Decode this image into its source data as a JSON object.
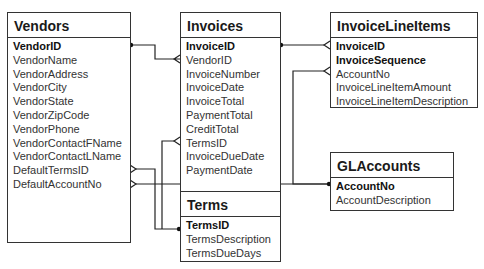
{
  "tables": {
    "vendors": {
      "name": "Vendors",
      "columns": [
        {
          "name": "VendorID",
          "pk": true
        },
        {
          "name": "VendorName",
          "pk": false
        },
        {
          "name": "VendorAddress",
          "pk": false
        },
        {
          "name": "VendorCity",
          "pk": false
        },
        {
          "name": "VendorState",
          "pk": false
        },
        {
          "name": "VendorZipCode",
          "pk": false
        },
        {
          "name": "VendorPhone",
          "pk": false
        },
        {
          "name": "VendorContactFName",
          "pk": false
        },
        {
          "name": "VendorContactLName",
          "pk": false
        },
        {
          "name": "DefaultTermsID",
          "pk": false
        },
        {
          "name": "DefaultAccountNo",
          "pk": false
        }
      ]
    },
    "invoices": {
      "name": "Invoices",
      "columns": [
        {
          "name": "InvoiceID",
          "pk": true
        },
        {
          "name": "VendorID",
          "pk": false
        },
        {
          "name": "InvoiceNumber",
          "pk": false
        },
        {
          "name": "InvoiceDate",
          "pk": false
        },
        {
          "name": "InvoiceTotal",
          "pk": false
        },
        {
          "name": "PaymentTotal",
          "pk": false
        },
        {
          "name": "CreditTotal",
          "pk": false
        },
        {
          "name": "TermsID",
          "pk": false
        },
        {
          "name": "InvoiceDueDate",
          "pk": false
        },
        {
          "name": "PaymentDate",
          "pk": false
        }
      ]
    },
    "invoicelineitems": {
      "name": "InvoiceLineItems",
      "columns": [
        {
          "name": "InvoiceID",
          "pk": true
        },
        {
          "name": "InvoiceSequence",
          "pk": true
        },
        {
          "name": "AccountNo",
          "pk": false
        },
        {
          "name": "InvoiceLineItemAmount",
          "pk": false
        },
        {
          "name": "InvoiceLineItemDescription",
          "pk": false
        }
      ]
    },
    "glaccounts": {
      "name": "GLAccounts",
      "columns": [
        {
          "name": "AccountNo",
          "pk": true
        },
        {
          "name": "AccountDescription",
          "pk": false
        }
      ]
    },
    "terms": {
      "name": "Terms",
      "columns": [
        {
          "name": "TermsID",
          "pk": true
        },
        {
          "name": "TermsDescription",
          "pk": false
        },
        {
          "name": "TermsDueDays",
          "pk": false
        }
      ]
    }
  },
  "relationships": [
    {
      "from": "Vendors.VendorID",
      "to": "Invoices.VendorID",
      "type": "one-to-many"
    },
    {
      "from": "Invoices.InvoiceID",
      "to": "InvoiceLineItems.InvoiceID",
      "type": "one-to-many"
    },
    {
      "from": "GLAccounts.AccountNo",
      "to": "InvoiceLineItems.AccountNo",
      "type": "one-to-many"
    },
    {
      "from": "GLAccounts.AccountNo",
      "to": "Vendors.DefaultAccountNo",
      "type": "one-to-many"
    },
    {
      "from": "Terms.TermsID",
      "to": "Vendors.DefaultTermsID",
      "type": "one-to-many"
    },
    {
      "from": "Terms.TermsID",
      "to": "Invoices.TermsID",
      "type": "one-to-many"
    }
  ],
  "colors": {
    "line": "#222222",
    "border": "#333333",
    "background": "#ffffff"
  }
}
